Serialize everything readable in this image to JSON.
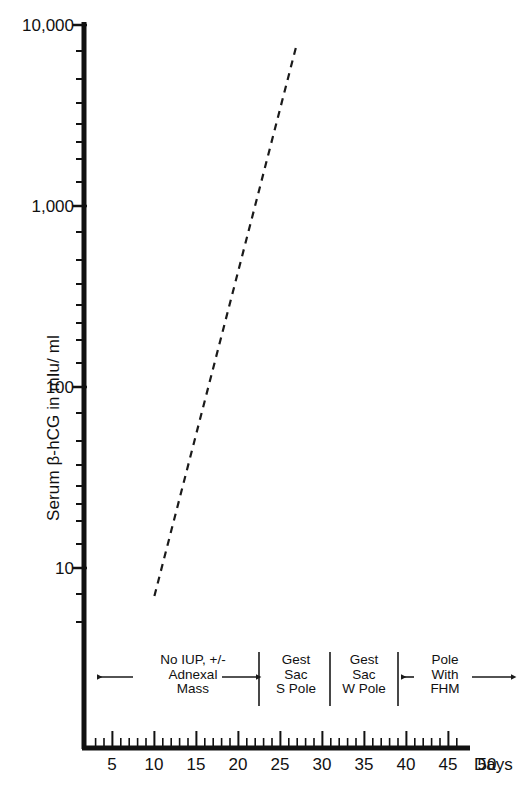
{
  "chart_data": {
    "type": "line",
    "title": "",
    "xlabel": "Days",
    "ylabel": "Serum β-hCG in mIu/ ml",
    "yscale": "log",
    "ylim": [
      7,
      10000
    ],
    "xlim": [
      0,
      53
    ],
    "grid": false,
    "legend": null,
    "y_tick_labels": [
      {
        "value": 10000,
        "label": "10,000"
      },
      {
        "value": 1000,
        "label": "1,000"
      },
      {
        "value": 100,
        "label": "100"
      },
      {
        "value": 10,
        "label": "10"
      }
    ],
    "x_tick_labels": [
      {
        "value": 5,
        "label": "5"
      },
      {
        "value": 10,
        "label": "10"
      },
      {
        "value": 15,
        "label": "15"
      },
      {
        "value": 20,
        "label": "20"
      },
      {
        "value": 25,
        "label": "25"
      },
      {
        "value": 30,
        "label": "30"
      },
      {
        "value": 35,
        "label": "35"
      },
      {
        "value": 40,
        "label": "40"
      },
      {
        "value": 45,
        "label": "45"
      },
      {
        "value": 50,
        "label": "50"
      }
    ],
    "series": [
      {
        "name": "Serum beta-hCG rise",
        "style": "dashed",
        "color": "#1a1a1a",
        "x": [
          10,
          27
        ],
        "y": [
          7,
          8000
        ]
      }
    ],
    "annotations": [
      {
        "id": "no-iup",
        "lines": [
          "No IUP, +/-",
          "Adnexal",
          "Mass"
        ],
        "x_start": 4,
        "x_end": 25.5
      },
      {
        "id": "gest-sac-s-pole",
        "lines": [
          "Gest",
          "Sac",
          "S Pole"
        ],
        "x_start": 25.5,
        "x_end": 34
      },
      {
        "id": "gest-sac-w-pole",
        "lines": [
          "Gest",
          "Sac",
          "W Pole"
        ],
        "x_start": 34,
        "x_end": 42
      },
      {
        "id": "pole-with-fhm",
        "lines": [
          "Pole",
          "With",
          "FHM"
        ],
        "x_start": 42,
        "x_end": 53
      }
    ]
  },
  "axis_colors": {
    "spine": "#111111",
    "series": "#1a1a1a",
    "annotation": "#1a1a1a"
  }
}
